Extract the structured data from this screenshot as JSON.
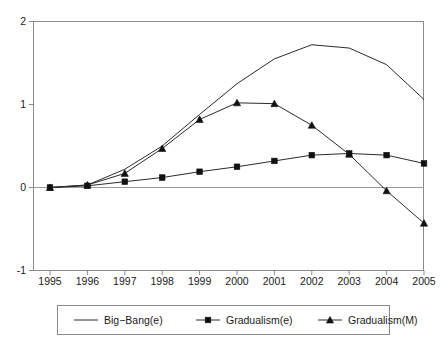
{
  "chart_data": {
    "type": "line",
    "title": "",
    "subtitle": "",
    "xlabel": "",
    "ylabel": "",
    "x": [
      1995,
      1996,
      1997,
      1998,
      1999,
      2000,
      2001,
      2002,
      2003,
      2004,
      2005
    ],
    "categories": [
      "1995",
      "1996",
      "1997",
      "1998",
      "1999",
      "2000",
      "2001",
      "2002",
      "2003",
      "2004",
      "2005"
    ],
    "xlim": [
      1995,
      2005
    ],
    "ylim": [
      -1,
      2
    ],
    "ytick_labels": [
      "2",
      "1",
      "0",
      "-1"
    ],
    "ytick_values": [
      2,
      1,
      0,
      -1
    ],
    "grid": false,
    "zero_line": true,
    "legend_position": "bottom",
    "series": [
      {
        "name": "Big−Bang(e)",
        "marker": "none",
        "values": [
          0.0,
          0.03,
          0.22,
          0.5,
          0.88,
          1.25,
          1.55,
          1.72,
          1.68,
          1.48,
          1.06
        ]
      },
      {
        "name": "Gradualism(e)",
        "marker": "square",
        "values": [
          0.0,
          0.02,
          0.07,
          0.12,
          0.19,
          0.25,
          0.32,
          0.39,
          0.41,
          0.39,
          0.29
        ]
      },
      {
        "name": "Gradualism(M)",
        "marker": "triangle",
        "values": [
          0.0,
          0.03,
          0.17,
          0.47,
          0.82,
          1.02,
          1.01,
          0.75,
          0.4,
          -0.04,
          -0.43
        ]
      }
    ]
  },
  "legend": {
    "entries": [
      {
        "label": "Big−Bang(e)",
        "marker": "none"
      },
      {
        "label": "Gradualism(e)",
        "marker": "square"
      },
      {
        "label": "Gradualism(M)",
        "marker": "triangle"
      }
    ]
  },
  "colors": {
    "line": "#2b2b2b",
    "marker": "#111111",
    "axis": "#8a8a8a",
    "zero_line": "#9a9a9a",
    "background": "#ffffff"
  }
}
